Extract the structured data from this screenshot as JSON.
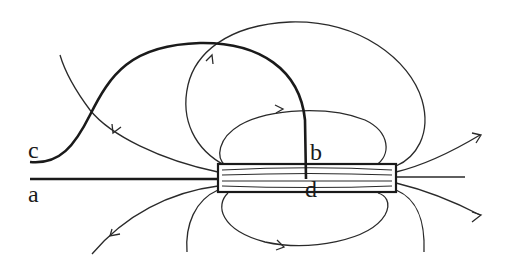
{
  "diagram": {
    "labels": {
      "a": "a",
      "b": "b",
      "c": "c",
      "d": "d"
    },
    "colors": {
      "line": "#2a2a2a",
      "wire": "#1a1a1a",
      "background": "#ffffff"
    }
  }
}
